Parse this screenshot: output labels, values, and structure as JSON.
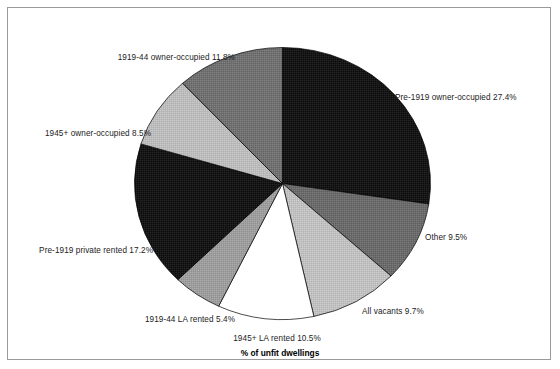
{
  "chart_data": {
    "type": "pie",
    "title": "",
    "xlabel": "% of unfit dwellings",
    "ylabel": "",
    "legend_position": "none",
    "grid": false,
    "units": "percent",
    "start_angle_deg": 0,
    "direction": "clockwise",
    "categories": [
      "Pre-1919 owner-occupied",
      "Other",
      "All vacants",
      "1945+ LA rented",
      "1919-44 LA rented",
      "Pre-1919 private rented",
      "1945+ owner-occupied",
      "1919-44 owner-occupied"
    ],
    "values": [
      27.4,
      9.5,
      9.7,
      10.5,
      5.4,
      17.2,
      8.5,
      11.8
    ],
    "labels": [
      "Pre-1919 owner-occupied 27.4%",
      "Other 9.5%",
      "All vacants 9.7%",
      "1945+ LA rented 10.5%",
      "1919-44 LA rented 5.4%",
      "Pre-1919 private rented 17.2%",
      "1945+ owner-occupied 8.5%",
      "1919-44 owner-occupied 11.8%"
    ],
    "colors": [
      "#161616",
      "#6b6b6b",
      "#c0c0c0",
      "#ffffff",
      "#9d9d9d",
      "#161616",
      "#bcbcbc",
      "#717171"
    ],
    "slice_edge_color": "#000000"
  },
  "chart": {
    "axis_title": "% of unfit dwellings",
    "labels": {
      "pre1919_owner_occupied": "Pre-1919 owner-occupied 27.4%",
      "other": "Other 9.5%",
      "all_vacants": "All vacants 9.7%",
      "la_rented_1945plus": "1945+ LA rented 10.5%",
      "la_rented_1919_44": "1919-44 LA rented 5.4%",
      "pre1919_private_rented": "Pre-1919 private rented 17.2%",
      "owner_occupied_1945plus": "1945+ owner-occupied 8.5%",
      "owner_occupied_1919_44": "1919-44 owner-occupied 11.8%"
    }
  }
}
